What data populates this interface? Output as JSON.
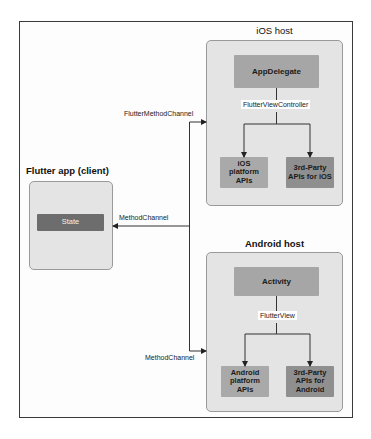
{
  "diagram": {
    "ios_host": {
      "title": "iOS host",
      "app_delegate": "AppDelegate",
      "view_controller_label": "FlutterViewController",
      "platform_apis": "iOS platform APIs",
      "platform_apis_lines": [
        "iOS",
        "platform",
        "APIs"
      ],
      "third_party_lines": [
        "3rd-Party",
        "APIs for iOS"
      ]
    },
    "android_host": {
      "title": "Android host",
      "activity": "Activity",
      "view_label": "FlutterView",
      "platform_apis_lines": [
        "Android",
        "platform",
        "APIs"
      ],
      "third_party_lines": [
        "3rd-Party",
        "APIs for",
        "Android"
      ]
    },
    "flutter_app": {
      "title": "Flutter app (client)",
      "state": "State"
    },
    "channels": {
      "ios_channel": "FlutterMethodChannel",
      "client_channel": "MethodChannel",
      "android_channel": "MethodChannel"
    },
    "colors": {
      "frame_border": "#3a3a3a",
      "host_fill": "#e4e4e4",
      "host_border": "#9a9a9a",
      "node_fill": "#a6a6a6",
      "node_dark_fill": "#8f8f8f",
      "state_fill": "#6d6d6d",
      "line": "#333333"
    }
  }
}
